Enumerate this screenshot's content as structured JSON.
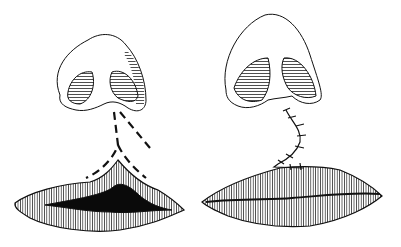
{
  "figure": {
    "panels": [
      {
        "id": "before",
        "label": "",
        "elements": [
          "nose",
          "dashed-incision-lines",
          "cleft-lip"
        ]
      },
      {
        "id": "after",
        "label": "",
        "elements": [
          "nose",
          "suture-line",
          "repaired-lip"
        ]
      }
    ],
    "colors": {
      "ink": "#111111",
      "background": "#ffffff"
    }
  }
}
